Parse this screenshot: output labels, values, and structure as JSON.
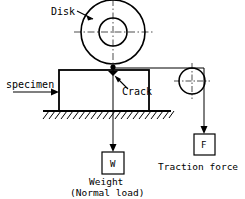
{
  "diagram": {
    "stroke_color": "#000000",
    "background_color": "#ffffff",
    "labels": {
      "disk": "Disk",
      "specimen": "specimen",
      "crack": "Crack",
      "weight_box": "W",
      "weight_line1": "Weight",
      "weight_line2": "(Normal load)",
      "force_box": "F",
      "traction": "Traction force"
    },
    "parts": [
      {
        "name": "disk",
        "type": "annulus",
        "cx": 113,
        "cy": 32,
        "outer_r": 32,
        "inner_r": 14,
        "label": "Disk"
      },
      {
        "name": "specimen-block",
        "type": "rectangle",
        "x": 59,
        "y": 70,
        "width": 90,
        "height": 41,
        "label": "specimen"
      },
      {
        "name": "ground",
        "type": "hatched-line",
        "x1": 43,
        "x2": 171,
        "y": 111,
        "hatch_count": 22
      },
      {
        "name": "pulley",
        "type": "circle",
        "cx": 192,
        "cy": 81,
        "r": 13
      },
      {
        "name": "weight-box",
        "type": "square",
        "x": 99,
        "y": 152,
        "size": 22,
        "label": "W"
      },
      {
        "name": "force-box",
        "type": "square",
        "x": 193,
        "y": 134,
        "size": 21,
        "label": "F"
      },
      {
        "name": "contact-point",
        "type": "dot",
        "cx": 113,
        "cy": 67
      },
      {
        "name": "crack-mark",
        "type": "dot",
        "cx": 113,
        "cy": 76
      }
    ],
    "centerlines": [
      {
        "name": "disk-horizontal-centerline",
        "x1": 74,
        "y1": 32,
        "x2": 154,
        "y2": 32
      },
      {
        "name": "disk-vertical-centerline",
        "x1": 113,
        "y1": -2,
        "x2": 113,
        "y2": 68
      },
      {
        "name": "pulley-horizontal-centerline",
        "x1": 173,
        "y1": 81,
        "x2": 212,
        "y2": 81
      },
      {
        "name": "pulley-vertical-centerline",
        "x1": 192,
        "y1": 62,
        "x2": 192,
        "y2": 100
      }
    ],
    "force_arrows": [
      {
        "name": "normal-load-line",
        "x1": 113,
        "y1": 67,
        "x2": 113,
        "y2": 151,
        "arrow": "down"
      },
      {
        "name": "traction-cord-horizontal",
        "x1": 113,
        "y1": 68,
        "x2": 204,
        "y2": 68
      },
      {
        "name": "traction-cord-vertical",
        "x1": 204,
        "y1": 68,
        "x2": 204,
        "y2": 133,
        "arrow": "down"
      },
      {
        "name": "specimen-leader",
        "x1": 13,
        "y1": 90,
        "x2": 57,
        "y2": 90,
        "arrow": "right"
      },
      {
        "name": "disk-leader",
        "x1": 78,
        "y1": 12,
        "x2": 93,
        "y2": 19,
        "arrow": "to-disk"
      },
      {
        "name": "crack-leader",
        "x1": 133,
        "y1": 92,
        "x2": 117,
        "y2": 78,
        "arrow": "to-crack"
      }
    ]
  }
}
